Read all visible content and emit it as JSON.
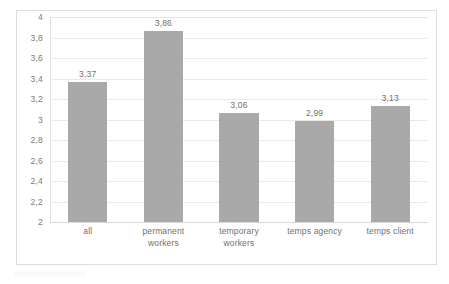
{
  "chart_data": {
    "type": "bar",
    "title": "",
    "subtitle": "",
    "xlabel": "",
    "ylabel": "",
    "categories": [
      "all",
      "permanent workers",
      "temporary workers",
      "temps agency",
      "temps client"
    ],
    "category_lines": [
      [
        "all"
      ],
      [
        "permanent",
        "workers"
      ],
      [
        "temporary",
        "workers"
      ],
      [
        "temps agency"
      ],
      [
        "temps client"
      ]
    ],
    "values": [
      3.37,
      3.86,
      3.06,
      2.99,
      3.13
    ],
    "value_labels": [
      "3,37",
      "3,86",
      "3,06",
      "2,99",
      "3,13"
    ],
    "ylim": [
      2,
      4
    ],
    "ytick_values": [
      2,
      2.2,
      2.4,
      2.6,
      2.8,
      3,
      3.2,
      3.4,
      3.6,
      3.8,
      4
    ],
    "ytick_labels": [
      "2",
      "2,2",
      "2,4",
      "2,6",
      "2,8",
      "3",
      "3,2",
      "3,4",
      "3,6",
      "3,8",
      "4"
    ],
    "grid": true,
    "grid_axis": "y",
    "legend": false,
    "legend_position": "none",
    "decimal_separator": ",",
    "colors": {
      "bar_fill": "#a9a9a9",
      "gridline": "#e8e8e8",
      "frame_border": "#dedede",
      "tick_label_text": "#7b7b7b",
      "value_label_text": "#6f6f6f",
      "plot_background": "#ffffff",
      "figure_background": "#ffffff"
    }
  }
}
